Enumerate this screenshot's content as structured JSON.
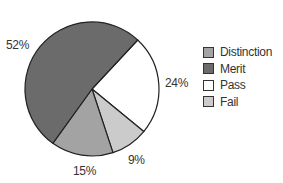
{
  "chart_data": {
    "type": "pie",
    "title": "",
    "categories": [
      "Distinction",
      "Merit",
      "Pass",
      "Fail"
    ],
    "values": [
      15,
      52,
      24,
      9
    ],
    "unit": "%",
    "colors": {
      "Distinction": "#a3a3a3",
      "Merit": "#6b6b6b",
      "Pass": "#ffffff",
      "Fail": "#cbcbcb"
    },
    "data_labels": [
      "15%",
      "52%",
      "24%",
      "9%"
    ],
    "legend_position": "right"
  },
  "labels": {
    "merit": "52%",
    "pass": "24%",
    "fail": "9%",
    "distinction": "15%"
  },
  "legend": [
    {
      "label": "Distinction",
      "color": "#a3a3a3"
    },
    {
      "label": "Merit",
      "color": "#6b6b6b"
    },
    {
      "label": "Pass",
      "color": "#ffffff"
    },
    {
      "label": "Fail",
      "color": "#cbcbcb"
    }
  ]
}
